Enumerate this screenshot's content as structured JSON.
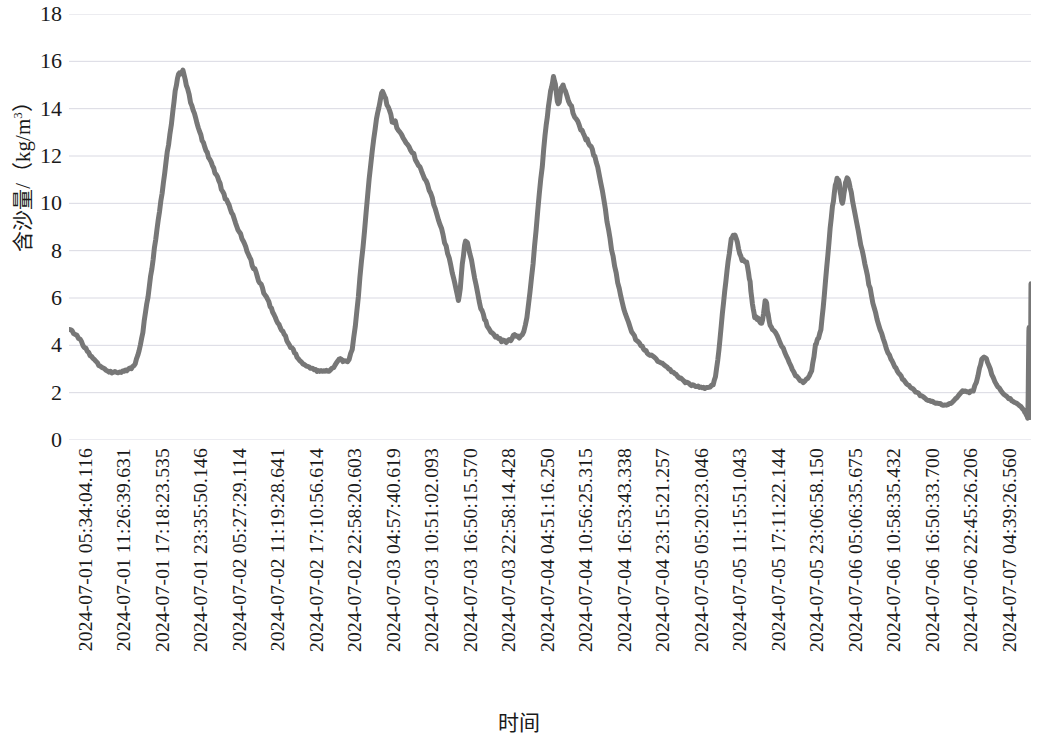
{
  "chart_data": {
    "type": "line",
    "title": "",
    "xlabel": "时间",
    "ylabel": "含沙量/（kg/m³）",
    "ylabel_parts": {
      "name": "含沙量",
      "sep": "/（kg/m",
      "exp": "3",
      "tail": "）"
    },
    "ylim": [
      0,
      18
    ],
    "ytick_step": 2,
    "yticks": [
      18,
      16,
      14,
      12,
      10,
      8,
      6,
      4,
      2,
      0
    ],
    "grid": true,
    "grid_axis": "y",
    "legend": "none",
    "line_color": "#777777",
    "line_width": 5,
    "series_name": "含沙量",
    "xtick_labels": [
      "2024-07-01 05:34:04.116",
      "2024-07-01 11:26:39.631",
      "2024-07-01 17:18:23.535",
      "2024-07-01 23:35:50.146",
      "2024-07-02 05:27:29.114",
      "2024-07-02 11:19:28.641",
      "2024-07-02 17:10:56.614",
      "2024-07-02 22:58:20.603",
      "2024-07-03 04:57:40.619",
      "2024-07-03 10:51:02.093",
      "2024-07-03 16:50:15.570",
      "2024-07-03 22:58:14.428",
      "2024-07-04 04:51:16.250",
      "2024-07-04 10:56:25.315",
      "2024-07-04 16:53:43.338",
      "2024-07-04 23:15:21.257",
      "2024-07-05 05:20:23.046",
      "2024-07-05 11:15:51.043",
      "2024-07-05 17:11:22.144",
      "2024-07-05 23:06:58.150",
      "2024-07-06 05:06:35.675",
      "2024-07-06 10:58:35.432",
      "2024-07-06 16:50:33.700",
      "2024-07-06 22:45:26.206",
      "2024-07-07 04:39:26.560",
      "2024-07-07 10:31:25.971"
    ],
    "x": [
      0.0,
      0.5,
      1.0,
      1.6,
      2.2,
      2.8,
      3.4,
      4.0,
      4.6,
      5.2,
      5.8,
      6.4,
      7.0,
      7.6,
      8.2,
      8.6,
      9.0,
      9.4,
      9.8,
      10.2,
      10.7,
      11.2,
      11.8,
      12.4,
      13.0,
      13.6,
      14.2,
      14.8,
      15.4,
      16.0,
      16.6,
      17.2,
      17.8,
      18.4,
      19.0,
      19.6,
      20.2,
      20.8,
      21.4,
      22.0,
      22.6,
      23.2,
      23.8,
      24.4,
      25.0
    ],
    "values_note": "含沙量 (kg/m³) sampled along the 7-day record",
    "values": [
      4.7,
      4.35,
      3.5,
      2.95,
      2.85,
      3.0,
      3.1,
      4.2,
      7.2,
      11.5,
      15.1,
      15.6,
      14.4,
      12.6,
      11.4,
      10.4,
      9.2,
      7.9,
      6.6,
      5.2,
      4.0,
      3.2,
      2.95,
      2.9,
      3.2,
      3.4,
      3.3,
      4.6,
      9.5,
      13.8,
      14.8,
      13.5,
      13.0,
      12.1,
      11.0,
      9.6,
      8.0,
      6.3,
      5.9,
      8.4,
      7.3,
      5.2,
      4.4,
      4.2,
      4.9
    ],
    "peaks": [
      {
        "label": "peak-1",
        "value": 15.6
      },
      {
        "label": "peak-2",
        "value": 14.8
      },
      {
        "label": "peak-3",
        "value": 15.3
      },
      {
        "label": "peak-4",
        "value": 8.7
      },
      {
        "label": "peak-5",
        "value": 11.1
      },
      {
        "label": "peak-6",
        "value": 3.5
      },
      {
        "label": "final-spike",
        "value": 6.6
      }
    ],
    "troughs": [
      {
        "label": "trough-1",
        "value": 2.85
      },
      {
        "label": "trough-2",
        "value": 2.9
      },
      {
        "label": "trough-3",
        "value": 4.1
      },
      {
        "label": "trough-4",
        "value": 2.2
      },
      {
        "label": "trough-5",
        "value": 2.45
      },
      {
        "label": "trough-6",
        "value": 1.45
      },
      {
        "label": "trough-7",
        "value": 0.9
      }
    ]
  }
}
